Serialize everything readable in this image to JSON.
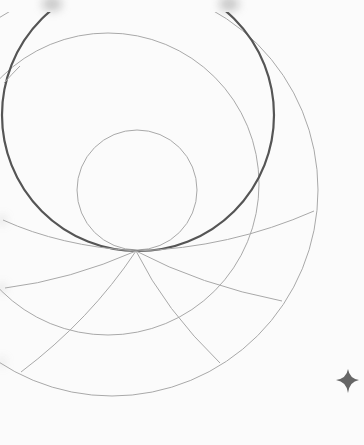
{
  "artwork": {
    "background": "#fbfbfb",
    "colors": {
      "bold_line": "#555555",
      "thin_line": "#a8a8a8",
      "star": "#666666",
      "smudge": "#9a9a9a"
    },
    "focal_point": {
      "x": 136,
      "y": 251
    },
    "bold_circle": {
      "cx": 138,
      "cy": 115,
      "r": 136
    },
    "small_circle": {
      "cx": 137,
      "cy": 190,
      "r": 60
    },
    "medium_circle": {
      "cx": 108,
      "cy": 184,
      "r": 151
    },
    "outer_circle": {
      "cx": 112,
      "cy": 190,
      "r": 206
    },
    "star": {
      "x": 348,
      "y": 380,
      "size": 9
    }
  }
}
